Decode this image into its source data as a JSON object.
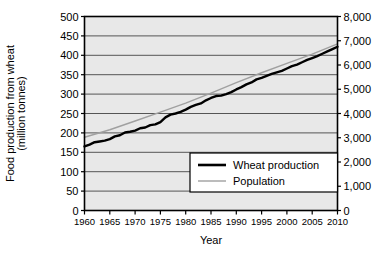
{
  "chart_data": {
    "type": "line",
    "title": "",
    "xlabel": "Year",
    "ylabel": "Food production from wheat (million tonnes)",
    "ylabel_right": "",
    "grid": true,
    "legend_position": "lower-right-inside",
    "xlim": [
      1960,
      2010
    ],
    "ylim": [
      0,
      500
    ],
    "ylim_right": [
      0,
      8000
    ],
    "xticks": [
      "1960",
      "1965",
      "1970",
      "1975",
      "1980",
      "1985",
      "1990",
      "1995",
      "2000",
      "2005",
      "2010"
    ],
    "xtick_values": [
      1960,
      1965,
      1970,
      1975,
      1980,
      1985,
      1990,
      1995,
      2000,
      2005,
      2010
    ],
    "yticks": [
      "0",
      "50",
      "100",
      "150",
      "200",
      "250",
      "300",
      "350",
      "400",
      "450",
      "500"
    ],
    "ytick_values": [
      0,
      50,
      100,
      150,
      200,
      250,
      300,
      350,
      400,
      450,
      500
    ],
    "yticks_right": [
      "0",
      "1,000",
      "2,000",
      "3,000",
      "4,000",
      "5,000",
      "6,000",
      "7,000",
      "8,000"
    ],
    "ytick_values_right": [
      0,
      1000,
      2000,
      3000,
      4000,
      5000,
      6000,
      7000,
      8000
    ],
    "series": [
      {
        "name": "Wheat production",
        "axis": "left",
        "color": "#000000",
        "width": 2.4,
        "x": [
          1960,
          1961,
          1962,
          1963,
          1964,
          1965,
          1966,
          1967,
          1968,
          1969,
          1970,
          1971,
          1972,
          1973,
          1974,
          1975,
          1976,
          1977,
          1978,
          1979,
          1980,
          1981,
          1982,
          1983,
          1984,
          1985,
          1986,
          1987,
          1988,
          1989,
          1990,
          1991,
          1992,
          1993,
          1994,
          1995,
          1996,
          1997,
          1998,
          1999,
          2000,
          2001,
          2002,
          2003,
          2004,
          2005,
          2006,
          2007,
          2008,
          2009,
          2010
        ],
        "values": [
          165,
          170,
          176,
          178,
          180,
          184,
          191,
          194,
          201,
          203,
          206,
          212,
          214,
          220,
          222,
          228,
          240,
          247,
          250,
          254,
          260,
          267,
          272,
          276,
          284,
          290,
          295,
          296,
          300,
          305,
          312,
          318,
          325,
          330,
          338,
          342,
          347,
          352,
          356,
          360,
          366,
          372,
          376,
          382,
          388,
          393,
          398,
          404,
          410,
          416,
          422
        ]
      },
      {
        "name": "Population",
        "axis": "right",
        "color": "#a0a0a0",
        "width": 1.4,
        "x": [
          1960,
          1965,
          1970,
          1975,
          1980,
          1985,
          1990,
          1995,
          2000,
          2005,
          2010
        ],
        "values": [
          3020,
          3330,
          3690,
          4060,
          4430,
          4840,
          5270,
          5680,
          6070,
          6450,
          6870
        ]
      }
    ],
    "legend": [
      {
        "label": "Wheat production",
        "color": "#000000",
        "width": 2.6
      },
      {
        "label": "Population",
        "color": "#a0a0a0",
        "width": 1.4
      }
    ]
  },
  "style": {
    "plot_background": "#e8e8e8",
    "grid_color": "#555555",
    "axis_color": "#000000",
    "legend_background": "#ffffff",
    "legend_border": "#000000",
    "page_background": "#ffffff"
  }
}
